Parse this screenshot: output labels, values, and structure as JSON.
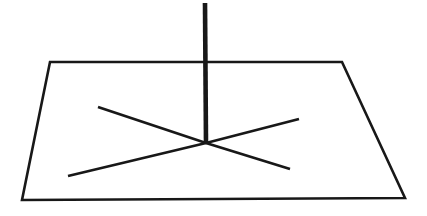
{
  "figure": {
    "background_color": "#ffffff",
    "ink_color": "#181818",
    "canvas": {
      "width": 427,
      "height": 216
    },
    "shapes": {
      "ground_plane": {
        "name": "ground-plane-quadrilateral",
        "description": "Quadrilateral drawn in perspective representing a flat horizontal plane",
        "stroke_width": 2.6,
        "points": "50,62 342,62 405,198 22,200"
      },
      "pole": {
        "name": "vertical-pole",
        "description": "Thick vertical line rising from the hub through the top edge of the plane",
        "stroke_width": 4.6,
        "x1": 205,
        "y1": 3,
        "x2": 206,
        "y2": 144
      },
      "hub": {
        "name": "spoke-convergence-hub",
        "x": 206,
        "y": 143
      },
      "spokes": [
        {
          "name": "spoke-upper-left",
          "stroke_width": 2.8,
          "x1": 98,
          "y1": 107,
          "x2": 206,
          "y2": 143
        },
        {
          "name": "spoke-upper-right",
          "stroke_width": 2.8,
          "x1": 299,
          "y1": 119,
          "x2": 206,
          "y2": 143
        },
        {
          "name": "spoke-lower-left",
          "stroke_width": 2.8,
          "x1": 68,
          "y1": 176,
          "x2": 206,
          "y2": 143
        },
        {
          "name": "spoke-lower-right",
          "stroke_width": 2.8,
          "x1": 290,
          "y1": 169,
          "x2": 206,
          "y2": 143
        }
      ]
    }
  }
}
